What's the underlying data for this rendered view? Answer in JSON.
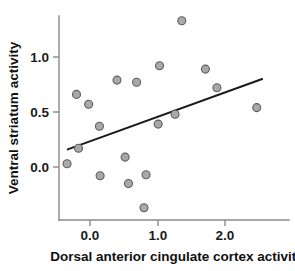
{
  "chart_data": {
    "type": "scatter",
    "title": "",
    "xlabel": "Dorsal anterior cingulate cortex activity",
    "ylabel": "Ventral striatum activity",
    "xlim": [
      -0.55,
      2.75
    ],
    "ylim": [
      -0.52,
      1.45
    ],
    "xticks": [
      0.0,
      1.0,
      2.0
    ],
    "xtick_labels": [
      "0.0",
      "1.0",
      "2.0"
    ],
    "yticks": [
      0.0,
      0.5,
      1.0
    ],
    "ytick_labels": [
      "0.0",
      "0.5",
      "1.0"
    ],
    "grid": false,
    "legend": null,
    "marker": {
      "shape": "circle",
      "fill_color": "#a8a8a8",
      "edge_color": "#5e5e5e",
      "size_px": 8
    },
    "points": [
      {
        "x": -0.34,
        "y": 0.03
      },
      {
        "x": -0.2,
        "y": 0.66
      },
      {
        "x": -0.17,
        "y": 0.17
      },
      {
        "x": -0.02,
        "y": 0.57
      },
      {
        "x": 0.14,
        "y": 0.37
      },
      {
        "x": 0.15,
        "y": -0.08
      },
      {
        "x": 0.4,
        "y": 0.79
      },
      {
        "x": 0.52,
        "y": 0.09
      },
      {
        "x": 0.57,
        "y": -0.15
      },
      {
        "x": 0.69,
        "y": 0.77
      },
      {
        "x": 0.8,
        "y": -0.37
      },
      {
        "x": 0.83,
        "y": -0.07
      },
      {
        "x": 1.01,
        "y": 0.39
      },
      {
        "x": 1.03,
        "y": 0.92
      },
      {
        "x": 1.26,
        "y": 0.48
      },
      {
        "x": 1.36,
        "y": 1.33
      },
      {
        "x": 1.71,
        "y": 0.89
      },
      {
        "x": 1.88,
        "y": 0.72
      },
      {
        "x": 2.47,
        "y": 0.54
      }
    ],
    "fit_line": {
      "type": "linear-regression",
      "color": "#1a1a1a",
      "x_start": -0.33,
      "y_start": 0.16,
      "x_end": 2.55,
      "y_end": 0.8
    }
  },
  "axes": {
    "x_axis_title": "Dorsal anterior cingulate cortex activity",
    "y_axis_title": "Ventral striatum activity",
    "x_tick_0": "0.0",
    "x_tick_1": "1.0",
    "x_tick_2": "2.0",
    "y_tick_0": "0.0",
    "y_tick_1": "0.5",
    "y_tick_2": "1.0"
  }
}
